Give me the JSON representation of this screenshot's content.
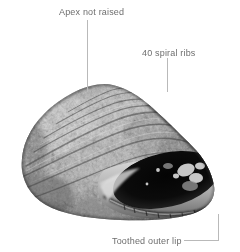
{
  "figure": {
    "background_color": "#ffffff",
    "leader_color": "#b4b4b4",
    "label_color": "#6e6e6e"
  },
  "annotations": [
    {
      "id": "apex",
      "label": "Apex not raised",
      "leader": "vertical-down",
      "target": "shell-apex"
    },
    {
      "id": "ribs",
      "label": "40 spiral ribs",
      "leader": "elbow-down",
      "target": "shell-body-whorl"
    },
    {
      "id": "lip",
      "label": "Toothed outer lip",
      "leader": "elbow-up-right",
      "target": "shell-outer-lip"
    }
  ],
  "specimen": {
    "name": "shell-photo",
    "description": "Grayscale photograph of a conical turbinate marine snail shell with mottled granular sculpture and a dark oval aperture at lower right.",
    "aperture": "dark-oval-aperture"
  }
}
